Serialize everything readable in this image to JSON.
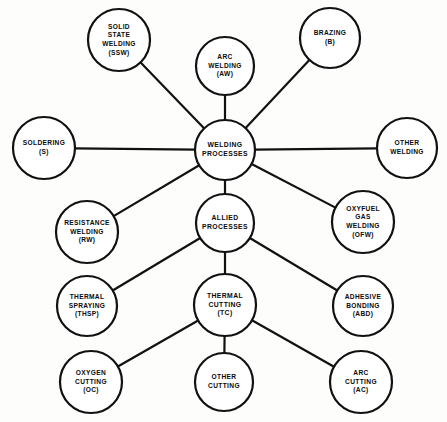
{
  "diagram": {
    "type": "node-link radial diagram",
    "stroke_color": "#111111",
    "node_fill": "#ffffff",
    "background": "#fdfdfc",
    "nodes": [
      {
        "id": "ssw",
        "name": "solid-state-welding",
        "lines": [
          "SOLID",
          "STATE",
          "WELDING",
          "(SSW)"
        ],
        "cx": 119,
        "cy": 40,
        "r": 31
      },
      {
        "id": "aw",
        "name": "arc-welding",
        "lines": [
          "ARC",
          "WELDING",
          "(AW)"
        ],
        "cx": 225,
        "cy": 66,
        "r": 29
      },
      {
        "id": "b",
        "name": "brazing",
        "lines": [
          "BRAZING",
          "(B)"
        ],
        "cx": 330,
        "cy": 38,
        "r": 30
      },
      {
        "id": "s",
        "name": "soldering",
        "lines": [
          "SOLDERING",
          "(S)"
        ],
        "cx": 44,
        "cy": 148,
        "r": 31
      },
      {
        "id": "wp",
        "name": "welding-processes",
        "lines": [
          "WELDING",
          "PROCESSES"
        ],
        "cx": 225,
        "cy": 150,
        "r": 30,
        "hub": true
      },
      {
        "id": "ow",
        "name": "other-welding",
        "lines": [
          "OTHER",
          "WELDING"
        ],
        "cx": 407,
        "cy": 148,
        "r": 30
      },
      {
        "id": "rw",
        "name": "resistance-welding",
        "lines": [
          "RESISTANCE",
          "WELDING",
          "(RW)"
        ],
        "cx": 87,
        "cy": 232,
        "r": 31
      },
      {
        "id": "ap",
        "name": "allied-processes",
        "lines": [
          "ALLIED",
          "PROCESSES"
        ],
        "cx": 225,
        "cy": 223,
        "r": 29,
        "hub": true
      },
      {
        "id": "ofw",
        "name": "oxyfuel-gas-welding",
        "lines": [
          "OXYFUEL",
          "GAS",
          "WELDING",
          "(OFW)"
        ],
        "cx": 363,
        "cy": 222,
        "r": 31
      },
      {
        "id": "thsp",
        "name": "thermal-spraying",
        "lines": [
          "THERMAL",
          "SPRAYING",
          "(THSP)"
        ],
        "cx": 87,
        "cy": 306,
        "r": 30
      },
      {
        "id": "tc",
        "name": "thermal-cutting",
        "lines": [
          "THERMAL",
          "CUTTING",
          "(TC)"
        ],
        "cx": 225,
        "cy": 305,
        "r": 31,
        "hub": true
      },
      {
        "id": "abd",
        "name": "adhesive-bonding",
        "lines": [
          "ADHESIVE",
          "BONDING",
          "(ABD)"
        ],
        "cx": 363,
        "cy": 306,
        "r": 30
      },
      {
        "id": "oc",
        "name": "oxygen-cutting",
        "lines": [
          "OXYGEN",
          "CUTTING",
          "(OC)"
        ],
        "cx": 91,
        "cy": 382,
        "r": 31
      },
      {
        "id": "othercut",
        "name": "other-cutting",
        "lines": [
          "OTHER",
          "CUTTING"
        ],
        "cx": 224,
        "cy": 382,
        "r": 29
      },
      {
        "id": "ac",
        "name": "arc-cutting",
        "lines": [
          "ARC",
          "CUTTING",
          "(AC)"
        ],
        "cx": 361,
        "cy": 382,
        "r": 31
      }
    ],
    "edges": [
      {
        "from": "wp",
        "to": "ssw",
        "name": "edge-welding-processes-solid-state-welding"
      },
      {
        "from": "wp",
        "to": "aw",
        "name": "edge-welding-processes-arc-welding"
      },
      {
        "from": "wp",
        "to": "b",
        "name": "edge-welding-processes-brazing"
      },
      {
        "from": "wp",
        "to": "s",
        "name": "edge-welding-processes-soldering"
      },
      {
        "from": "wp",
        "to": "ow",
        "name": "edge-welding-processes-other-welding"
      },
      {
        "from": "wp",
        "to": "rw",
        "name": "edge-welding-processes-resistance-welding"
      },
      {
        "from": "wp",
        "to": "ofw",
        "name": "edge-welding-processes-oxyfuel-gas-welding"
      },
      {
        "from": "wp",
        "to": "ap",
        "name": "edge-welding-processes-allied-processes"
      },
      {
        "from": "ap",
        "to": "thsp",
        "name": "edge-allied-processes-thermal-spraying"
      },
      {
        "from": "ap",
        "to": "abd",
        "name": "edge-allied-processes-adhesive-bonding"
      },
      {
        "from": "ap",
        "to": "tc",
        "name": "edge-allied-processes-thermal-cutting"
      },
      {
        "from": "tc",
        "to": "oc",
        "name": "edge-thermal-cutting-oxygen-cutting"
      },
      {
        "from": "tc",
        "to": "othercut",
        "name": "edge-thermal-cutting-other-cutting"
      },
      {
        "from": "tc",
        "to": "ac",
        "name": "edge-thermal-cutting-arc-cutting"
      }
    ]
  }
}
